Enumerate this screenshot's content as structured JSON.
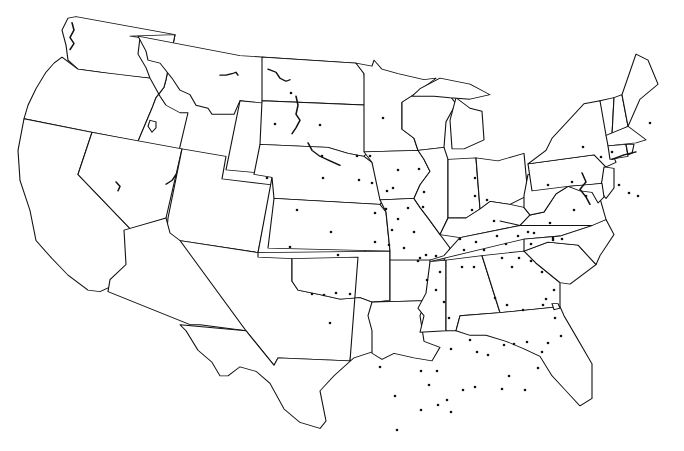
{
  "map": {
    "type": "us-contiguous-states-outline",
    "background": "#ffffff",
    "stroke_color": "#111111",
    "dot_color": "#111111",
    "dot_radius": 1.3,
    "states": [
      {
        "name": "WA",
        "d": "M68,24 L76,22 L175,46 L166,106 L150,104 L118,100 L100,96 L78,92 L68,80 L66,60 L62,40 Z"
      },
      {
        "name": "OR",
        "d": "M62,76 L78,92 L100,96 L150,104 L166,106 L164,116 L156,130 L152,144 L138,188 L24,158 L28,140 L36,118 L46,96 L54,84 Z"
      },
      {
        "name": "CA",
        "d": "M24,158 L92,176 L78,232 L140,318 L136,346 L126,372 L100,388 L88,386 L68,366 L52,344 L36,320 L30,280 L20,240 L18,200 Z"
      },
      {
        "name": "ID",
        "d": "M130,48 L140,50 L138,72 L146,90 L150,104 L160,128 L166,140 L180,150 L188,150 L178,206 L138,188 L152,144 L156,130 L164,116 L166,106 L175,46 Z"
      },
      {
        "name": "NV",
        "d": "M92,176 L182,198 L166,290 L156,304 L152,320 L140,318 L78,232 Z"
      },
      {
        "name": "MT",
        "d": "M138,48 L240,74 L356,84 L348,148 L262,138 L240,134 L234,152 L212,152 L208,144 L196,140 L190,126 L180,120 L172,104 L160,84 L148,80 L146,68 Z"
      },
      {
        "name": "WY",
        "d": "M240,134 L348,148 L340,240 L226,226 Z"
      },
      {
        "name": "UT",
        "d": "M182,198 L226,208 L222,238 L272,246 L258,336 L166,320 L168,290 Z"
      },
      {
        "name": "CO",
        "d": "M272,236 L370,250 L364,346 L258,336 Z"
      },
      {
        "name": "AZ",
        "d": "M124,306 L166,290 L170,310 L180,320 L258,336 L246,440 L200,432 L190,432 L108,388 L110,372 L126,352 Z"
      },
      {
        "name": "NM",
        "d": "M180,320 L258,336 L364,346 L350,480 L278,476 L274,486 L246,440 Z"
      },
      {
        "name": "ND",
        "d": "M262,76 L356,84 L364,98 L370,140 L262,134 Z"
      },
      {
        "name": "SD",
        "d": "M262,134 L370,140 L372,150 L372,196 L364,208 L348,204 L328,196 L260,192 Z"
      },
      {
        "name": "NE",
        "d": "M260,192 L328,196 L348,204 L364,208 L372,216 L380,236 L386,260 L380,272 L274,264 L272,236 L254,232 Z"
      },
      {
        "name": "KS",
        "d": "M274,264 L380,272 L386,282 L390,334 L268,330 Z"
      },
      {
        "name": "OK",
        "d": "M258,336 L390,334 L390,400 L372,402 L360,396 L340,398 L320,392 L298,386 L292,374 L292,344 L258,342 Z"
      },
      {
        "name": "TX",
        "d": "M292,344 L292,374 L298,386 L320,392 L340,398 L360,396 L372,402 L392,406 L398,446 L386,462 L354,476 L334,500 L320,520 L326,560 L320,570 L300,562 L284,544 L270,510 L256,494 L240,488 L228,500 L220,500 L212,482 L198,466 L186,440 L180,432 L246,440 L274,486 L278,476 L350,480 L358,342 Z"
      },
      {
        "name": "MN",
        "d": "M356,84 L372,88 L374,80 L382,92 L398,98 L424,106 L436,104 L416,124 L402,136 L402,172 L414,184 L418,200 L364,202 L364,98 Z"
      },
      {
        "name": "IA",
        "d": "M364,202 L418,200 L424,212 L430,228 L420,246 L414,264 L380,266 L372,216 Z"
      },
      {
        "name": "MO",
        "d": "M380,266 L414,264 L420,276 L428,290 L440,312 L450,330 L444,346 L390,346 L390,334 L386,282 Z"
      },
      {
        "name": "AR",
        "d": "M390,346 L444,346 L440,362 L430,378 L426,400 L372,402 L390,400 Z"
      },
      {
        "name": "LA",
        "d": "M372,402 L426,400 L420,420 L424,454 L440,462 L432,480 L414,476 L394,470 L382,478 L372,470 L372,440 L368,420 Z"
      },
      {
        "name": "WI",
        "d": "M402,136 L416,124 L430,116 L448,124 L456,138 L446,162 L444,196 L418,200 L414,184 L402,172 Z"
      },
      {
        "name": "IL",
        "d": "M418,200 L444,196 L448,212 L448,290 L440,312 L428,290 L420,276 L414,264 L420,246 L430,228 L424,212 Z"
      },
      {
        "name": "MI",
        "d": "M456,130 L470,144 L482,148 L484,186 L464,198 L452,198 L450,160 Z"
      },
      {
        "name": "MI-UP",
        "d": "M412,128 L420,118 L440,104 L470,112 L490,126 L470,132 L450,130 L434,128 Z"
      },
      {
        "name": "IN",
        "d": "M448,212 L476,210 L480,278 L466,290 L448,290 Z"
      },
      {
        "name": "OH",
        "d": "M476,210 L498,214 L524,204 L528,260 L510,272 L490,268 L480,278 Z"
      },
      {
        "name": "KY",
        "d": "M440,312 L448,290 L466,290 L480,278 L490,268 L510,272 L524,276 L530,286 L520,300 L460,316 Z"
      },
      {
        "name": "TN",
        "d": "M430,346 L444,340 L460,316 L520,300 L600,288 L592,300 L560,314 L524,318 L430,348 Z"
      },
      {
        "name": "MS",
        "d": "M430,348 L446,346 L446,440 L420,442 L424,420 L418,410 L426,390 Z"
      },
      {
        "name": "AL",
        "d": "M446,346 L482,340 L500,416 L460,420 L456,440 L446,440 Z"
      },
      {
        "name": "GA",
        "d": "M482,340 L524,334 L536,350 L560,376 L560,408 L500,416 Z"
      },
      {
        "name": "FL",
        "d": "M456,440 L460,420 L500,416 L560,408 L564,420 L578,452 L592,484 L592,530 L580,540 L566,520 L552,500 L540,474 L524,464 L506,454 L486,446 L470,446 Z"
      },
      {
        "name": "SC",
        "d": "M524,334 L548,322 L578,326 L596,352 L570,378 L560,376 L536,350 Z"
      },
      {
        "name": "NC",
        "d": "M524,318 L560,314 L592,300 L606,292 L614,312 L600,340 L596,352 L578,326 L548,322 L524,334 Z"
      },
      {
        "name": "VA",
        "d": "M500,294 L520,300 L530,286 L544,282 L556,258 L568,248 L588,252 L600,264 L606,292 L592,300 L520,300 Z"
      },
      {
        "name": "WV",
        "d": "M524,260 L528,232 L540,232 L548,244 L566,240 L568,248 L556,258 L544,282 L530,286 L524,276 Z"
      },
      {
        "name": "PA",
        "d": "M528,218 L594,206 L606,222 L602,244 L588,246 L568,248 L532,254 Z"
      },
      {
        "name": "NY",
        "d": "M528,218 L546,200 L552,184 L584,138 L600,134 L606,160 L610,196 L616,216 L606,222 L594,206 Z"
      },
      {
        "name": "VT",
        "d": "M600,134 L614,130 L612,180 L606,180 Z"
      },
      {
        "name": "NH",
        "d": "M614,130 L622,126 L628,168 L612,180 Z"
      },
      {
        "name": "ME",
        "d": "M622,126 L636,72 L648,80 L658,112 L640,132 L628,168 Z"
      },
      {
        "name": "MA",
        "d": "M606,180 L628,168 L636,176 L646,186 L636,190 L608,194 Z"
      },
      {
        "name": "CT",
        "d": "M608,194 L626,192 L628,208 L610,212 Z"
      },
      {
        "name": "RI",
        "d": "M626,192 L634,192 L632,204 L628,206 Z"
      },
      {
        "name": "NJ",
        "d": "M604,222 L614,224 L614,250 L606,264 L600,254 L602,240 Z"
      },
      {
        "name": "DE-MD",
        "d": "M568,248 L602,244 L604,262 L598,270 L592,256 L580,254 Z"
      }
    ],
    "dots": [
      [
        291,
        93
      ],
      [
        275,
        124
      ],
      [
        320,
        125
      ],
      [
        322,
        156
      ],
      [
        323,
        178
      ],
      [
        267,
        178
      ],
      [
        297,
        210
      ],
      [
        331,
        232
      ],
      [
        290,
        247
      ],
      [
        338,
        255
      ],
      [
        312,
        294
      ],
      [
        324,
        295
      ],
      [
        336,
        293
      ],
      [
        350,
        294
      ],
      [
        330,
        323
      ],
      [
        383,
        118
      ],
      [
        357,
        156
      ],
      [
        370,
        156
      ],
      [
        359,
        180
      ],
      [
        372,
        183
      ],
      [
        387,
        191
      ],
      [
        393,
        188
      ],
      [
        386,
        209
      ],
      [
        408,
        208
      ],
      [
        375,
        213
      ],
      [
        398,
        219
      ],
      [
        392,
        230
      ],
      [
        375,
        242
      ],
      [
        389,
        245
      ],
      [
        404,
        248
      ],
      [
        398,
        170
      ],
      [
        419,
        169
      ],
      [
        424,
        192
      ],
      [
        423,
        207
      ],
      [
        414,
        232
      ],
      [
        418,
        261
      ],
      [
        427,
        280
      ],
      [
        475,
        178
      ],
      [
        475,
        196
      ],
      [
        472,
        210
      ],
      [
        487,
        200
      ],
      [
        494,
        221
      ],
      [
        420,
        258
      ],
      [
        426,
        255
      ],
      [
        436,
        256
      ],
      [
        440,
        272
      ],
      [
        436,
        290
      ],
      [
        444,
        302
      ],
      [
        449,
        318
      ],
      [
        460,
        239
      ],
      [
        464,
        250
      ],
      [
        476,
        242
      ],
      [
        484,
        250
      ],
      [
        462,
        267
      ],
      [
        474,
        267
      ],
      [
        497,
        236
      ],
      [
        506,
        244
      ],
      [
        518,
        236
      ],
      [
        502,
        258
      ],
      [
        512,
        267
      ],
      [
        519,
        258
      ],
      [
        495,
        298
      ],
      [
        507,
        305
      ],
      [
        523,
        310
      ],
      [
        546,
        299
      ],
      [
        554,
        290
      ],
      [
        531,
        261
      ],
      [
        542,
        272
      ],
      [
        543,
        305
      ],
      [
        555,
        318
      ],
      [
        528,
        232
      ],
      [
        534,
        233
      ],
      [
        550,
        223
      ],
      [
        553,
        240
      ],
      [
        531,
        244
      ],
      [
        548,
        185
      ],
      [
        572,
        182
      ],
      [
        586,
        196
      ],
      [
        574,
        210
      ],
      [
        553,
        238
      ],
      [
        562,
        239
      ],
      [
        583,
        147
      ],
      [
        601,
        157
      ],
      [
        612,
        152
      ],
      [
        619,
        185
      ],
      [
        629,
        193
      ],
      [
        638,
        196
      ],
      [
        650,
        123
      ],
      [
        451,
        349
      ],
      [
        470,
        340
      ],
      [
        477,
        352
      ],
      [
        488,
        355
      ],
      [
        504,
        345
      ],
      [
        514,
        344
      ],
      [
        527,
        342
      ],
      [
        548,
        343
      ],
      [
        561,
        336
      ],
      [
        380,
        367
      ],
      [
        395,
        396
      ],
      [
        397,
        430
      ],
      [
        421,
        371
      ],
      [
        429,
        385
      ],
      [
        437,
        371
      ],
      [
        421,
        410
      ],
      [
        438,
        405
      ],
      [
        447,
        400
      ],
      [
        463,
        390
      ],
      [
        475,
        387
      ],
      [
        451,
        412
      ],
      [
        502,
        389
      ],
      [
        509,
        376
      ],
      [
        525,
        390
      ],
      [
        538,
        368
      ],
      [
        542,
        352
      ]
    ]
  }
}
